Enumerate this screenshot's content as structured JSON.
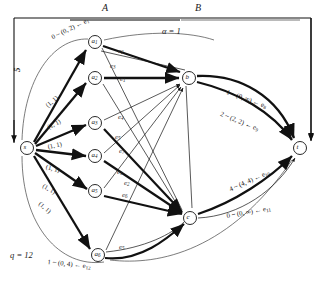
{
  "figure": {
    "headers": {
      "left": "A",
      "right": "B"
    },
    "annotations": {
      "alpha": "α = 1",
      "q": "q = 12",
      "source_flow": "5"
    },
    "nodes": [
      {
        "id": "s",
        "label": "s",
        "x": 27,
        "y": 148
      },
      {
        "id": "a1",
        "label": "a",
        "sub": "1",
        "x": 95,
        "y": 42
      },
      {
        "id": "a2",
        "label": "a",
        "sub": "2",
        "x": 95,
        "y": 78
      },
      {
        "id": "a3",
        "label": "a",
        "sub": "3",
        "x": 95,
        "y": 123
      },
      {
        "id": "a4",
        "label": "a",
        "sub": "4",
        "x": 95,
        "y": 156
      },
      {
        "id": "a5",
        "label": "a",
        "sub": "5",
        "x": 95,
        "y": 191
      },
      {
        "id": "a6",
        "label": "a",
        "sub": "6",
        "x": 98,
        "y": 255
      },
      {
        "id": "b",
        "label": "b",
        "x": 189,
        "y": 78
      },
      {
        "id": "c",
        "label": "c",
        "x": 190,
        "y": 218
      },
      {
        "id": "t",
        "label": "t",
        "x": 300,
        "y": 148
      }
    ],
    "source_edge_labels": [
      {
        "text": "(1, 1)",
        "x": 44,
        "y": 103,
        "rot": -40
      },
      {
        "text": "(1, 1)",
        "x": 46,
        "y": 124,
        "rot": -28
      },
      {
        "text": "(1, 1)",
        "x": 47,
        "y": 143,
        "rot": -12
      },
      {
        "text": "(1, 1)",
        "x": 47,
        "y": 163,
        "rot": 14
      },
      {
        "text": "(1, 1)",
        "x": 45,
        "y": 182,
        "rot": 30
      },
      {
        "text": "(1, 1)",
        "x": 42,
        "y": 200,
        "rot": 40
      }
    ],
    "edge_names": [
      {
        "text": "e",
        "sub": "1",
        "x": 120,
        "y": 75
      },
      {
        "text": "e",
        "sub": "2",
        "x": 118,
        "y": 47
      },
      {
        "text": "e",
        "sub": "3",
        "x": 110,
        "y": 62
      },
      {
        "text": "e",
        "sub": "4",
        "x": 118,
        "y": 113
      },
      {
        "text": "e",
        "sub": "5",
        "x": 115,
        "y": 133
      },
      {
        "text": "e",
        "sub": "6",
        "x": 122,
        "y": 191
      },
      {
        "text": "e",
        "sub": "7",
        "x": 119,
        "y": 147
      },
      {
        "text": "e",
        "sub": "1",
        "x": 117,
        "y": 168
      },
      {
        "text": "e",
        "sub": "2",
        "x": 124,
        "y": 179
      },
      {
        "text": "e",
        "sub": "5",
        "x": 119,
        "y": 243
      }
    ],
    "capacity_labels": [
      {
        "text": "0 ~ (0, 2) ← e",
        "sub": "1",
        "x": 50,
        "y": 34,
        "rot": -26
      },
      {
        "text": "1 ~ (0, ∞) ← e",
        "sub": "8",
        "x": 228,
        "y": 88,
        "rot": 20
      },
      {
        "text": "2 ~ (2, 2) ← e",
        "sub": "9",
        "x": 222,
        "y": 110,
        "rot": 22
      },
      {
        "text": "4 ~ (4, 4) ← e",
        "sub": "10",
        "x": 228,
        "y": 186,
        "rot": -24
      },
      {
        "text": "0 ~ (0, ∞) ← e",
        "sub": "11",
        "x": 226,
        "y": 212,
        "rot": -10
      },
      {
        "text": "1 ~ (0, 4) ← e",
        "sub": "12",
        "x": 48,
        "y": 258,
        "rot": 6
      }
    ]
  }
}
